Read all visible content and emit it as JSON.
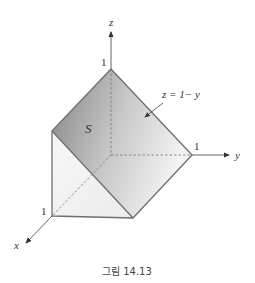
{
  "figure": {
    "caption": "그림 14.13",
    "axes": {
      "x_label": "x",
      "y_label": "y",
      "z_label": "z"
    },
    "ticks": {
      "z_one": "1",
      "y_one": "1",
      "x_one": "1"
    },
    "surface_label": "S",
    "plane_equation": "z = 1− y"
  },
  "colors": {
    "edge": "#6f6f6f",
    "axis": "#555555",
    "surface_dark": "#8c8c8c",
    "surface_light": "#f2f2f2",
    "side_face": "#f3f3f3"
  }
}
